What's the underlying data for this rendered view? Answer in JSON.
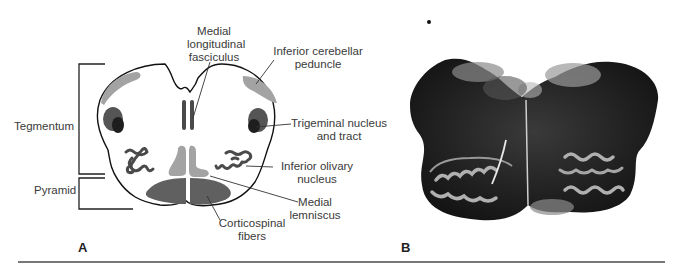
{
  "figure": {
    "panel_a": {
      "letter": "A",
      "brackets": {
        "tegmentum": "Tegmentum",
        "pyramid": "Pyramid"
      },
      "labels": {
        "mlf_line1": "Medial",
        "mlf_line2": "longitudinal",
        "mlf_line3": "fasciculus",
        "icp_line1": "Inferior cerebellar",
        "icp_line2": "peduncle",
        "trig_line1": "Trigeminal nucleus",
        "trig_line2": "and tract",
        "ion_line1": "Inferior olivary",
        "ion_line2": "nucleus",
        "ml_line1": "Medial",
        "ml_line2": "lemniscus",
        "cst_line1": "Corticospinal",
        "cst_line2": "fibers"
      },
      "colors": {
        "outline": "#111111",
        "light_gray": "#a3a3a3",
        "mid_gray": "#6e6e6e",
        "dark": "#2a2a2a"
      }
    },
    "panel_b": {
      "letter": "B",
      "description": "Stained histological cross-section of medulla"
    }
  }
}
